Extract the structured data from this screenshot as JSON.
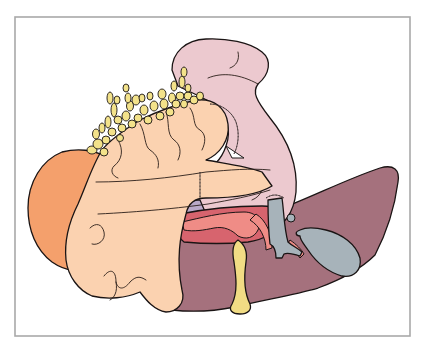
{
  "figure": {
    "type": "anatomical-illustration",
    "caption": "",
    "frame": {
      "x": 15,
      "y": 17,
      "width": 395,
      "height": 319,
      "border_color": "#a9a9a9"
    },
    "colors": {
      "background": "#ffffff",
      "outline": "#1a1414",
      "orange_organ": "#f4a06c",
      "peach_mass": "#fbd2b0",
      "fat_globules": "#f3e28a",
      "pink_loop": "#ecc9cf",
      "liver": "#a5717d",
      "red_structure": "#d7646e",
      "red_vessels": "#ef8c86",
      "yellow_duct": "#f1dc84",
      "gray_duct": "#a7b3ba",
      "lavender_patch": "#b9a9c9"
    },
    "regions": [
      {
        "name": "orange-organ",
        "label": ""
      },
      {
        "name": "peach-mass",
        "label": ""
      },
      {
        "name": "fat-globules",
        "label": ""
      },
      {
        "name": "pink-intestinal-loop",
        "label": ""
      },
      {
        "name": "liver",
        "label": ""
      },
      {
        "name": "red-structure",
        "label": ""
      },
      {
        "name": "yellow-duct",
        "label": ""
      },
      {
        "name": "gray-duct",
        "label": ""
      },
      {
        "name": "gallbladder",
        "label": ""
      }
    ]
  }
}
